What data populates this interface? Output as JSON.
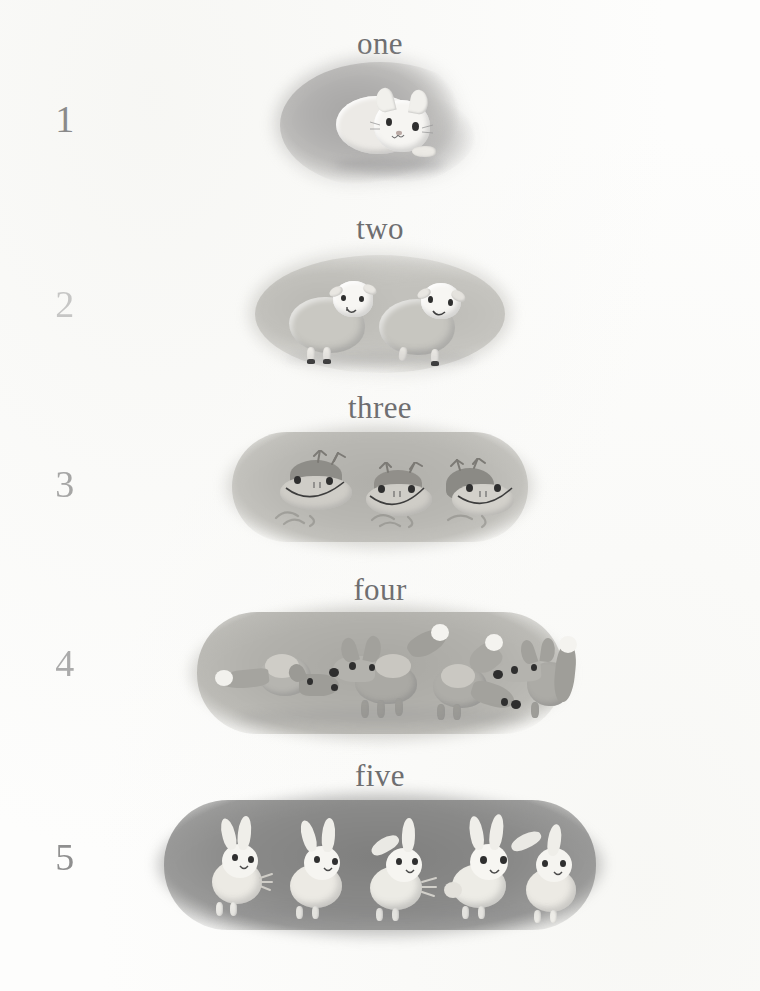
{
  "page": {
    "width": 760,
    "height": 991,
    "background_color": "#fdfdfc",
    "numeral_color": "#8a8a8a",
    "word_color": "#6e6e70"
  },
  "rows": [
    {
      "numeral": "1",
      "word": "one",
      "count": 1,
      "animal": "cat",
      "animal_plural": "cat",
      "blob_color": "#b4b3b2",
      "blob_shape": "round-oval",
      "numeral_opacity": 1.0
    },
    {
      "numeral": "2",
      "word": "two",
      "count": 2,
      "animal": "sheep",
      "animal_plural": "sheep",
      "blob_color": "#c2c2bd",
      "blob_shape": "wide-oval",
      "numeral_opacity": 0.45
    },
    {
      "numeral": "3",
      "word": "three",
      "count": 3,
      "animal": "frog",
      "animal_plural": "frogs",
      "blob_color": "#b9b8b3",
      "blob_shape": "pill",
      "numeral_opacity": 0.75
    },
    {
      "numeral": "4",
      "word": "four",
      "count": 4,
      "animal": "fox",
      "animal_plural": "foxes",
      "blob_color": "#b0afab",
      "blob_shape": "pill",
      "numeral_opacity": 0.7
    },
    {
      "numeral": "5",
      "word": "five",
      "count": 5,
      "animal": "bunny",
      "animal_plural": "bunnies",
      "blob_color": "#8d8d8c",
      "blob_shape": "pill",
      "numeral_opacity": 0.95
    }
  ]
}
